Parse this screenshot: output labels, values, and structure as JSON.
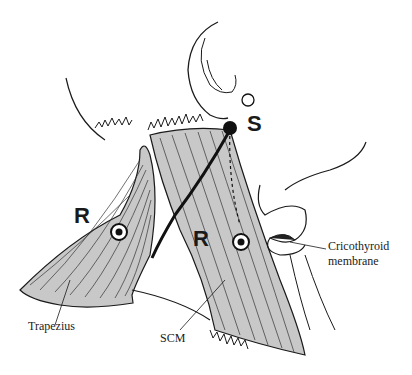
{
  "diagram": {
    "type": "anatomical-illustration",
    "markers": {
      "S": "S",
      "R_left": "R",
      "R_right": "R"
    },
    "labels": {
      "trapezius": "Trapezius",
      "scm": "SCM",
      "cricothyroid_line1": "Cricothyroid",
      "cricothyroid_line2": "membrane"
    },
    "colors": {
      "muscle_fill": "#c8c8c8",
      "line": "#1a1a1a",
      "background": "#ffffff"
    }
  }
}
